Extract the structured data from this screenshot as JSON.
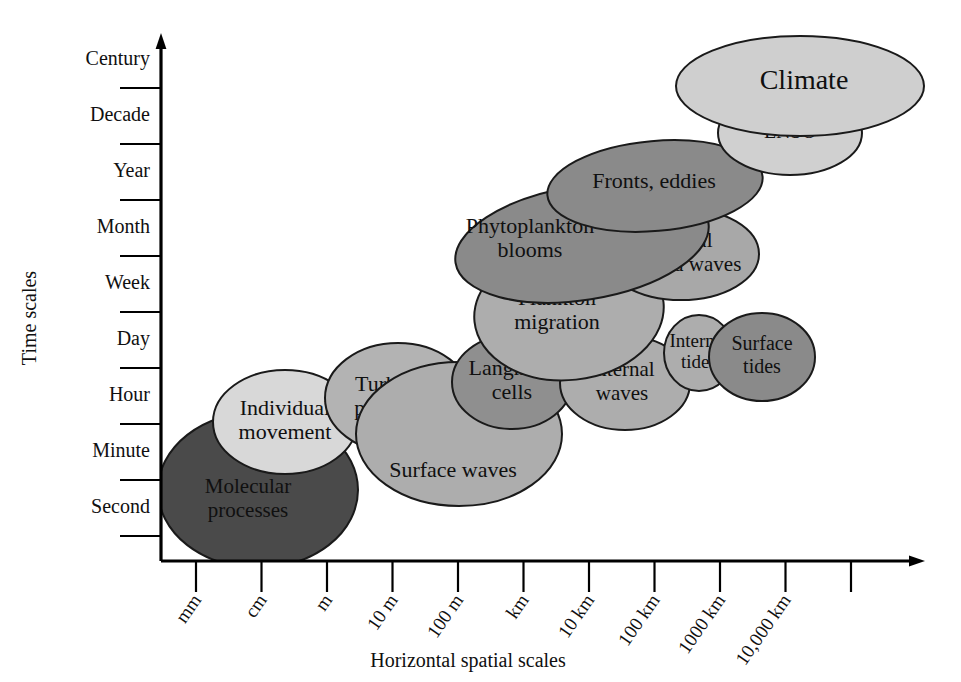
{
  "chart_data": {
    "type": "scatter",
    "title": "",
    "xlabel": "Horizontal spatial scales",
    "ylabel": "Time scales",
    "grid": false,
    "legend": "none",
    "xticks": [
      "mm",
      "cm",
      "m",
      "10 m",
      "100 m",
      "km",
      "10 km",
      "100 km",
      "1000 km",
      "10,000 km"
    ],
    "yticks": [
      "Century",
      "Decade",
      "Year",
      "Month",
      "Week",
      "Day",
      "Hour",
      "Minute",
      "Second"
    ],
    "xlim": [
      "mm",
      "beyond 10,000 km"
    ],
    "ylim": [
      "Second",
      "Century"
    ],
    "bubbles": [
      {
        "label": "Molecular processes",
        "label_lines": [
          "Molecular",
          "processes"
        ],
        "fill": "#4a4a4a",
        "text_color": "#141414",
        "font_size": 21,
        "cx": 258,
        "cy": 490,
        "rx": 100,
        "ry": 78,
        "rotate": 0,
        "label_dx": -10,
        "label_dy": 10,
        "x_scale": "mm",
        "y_scale": "Second to Minute"
      },
      {
        "label": "Individual movement",
        "label_lines": [
          "Individual",
          "movement"
        ],
        "fill": "#d8d8d8",
        "text_color": "#141414",
        "font_size": 22,
        "cx": 285,
        "cy": 422,
        "rx": 72,
        "ry": 52,
        "rotate": 0,
        "label_dx": 0,
        "label_dy": 0,
        "x_scale": "cm",
        "y_scale": "Minute to Hour"
      },
      {
        "label": "Turbulent patch size",
        "label_lines": [
          "Turbulent",
          "patch size"
        ],
        "fill": "#b3b3b3",
        "text_color": "#141414",
        "font_size": 22,
        "cx": 398,
        "cy": 398,
        "rx": 73,
        "ry": 55,
        "rotate": 0,
        "label_dx": 0,
        "label_dy": 0,
        "x_scale": "10 m",
        "y_scale": "Minute to Hour"
      },
      {
        "label": "Surface waves",
        "label_lines": [
          "Surface waves"
        ],
        "fill": "#adadad",
        "text_color": "#141414",
        "font_size": 22,
        "cx": 459,
        "cy": 434,
        "rx": 103,
        "ry": 72,
        "rotate": 0,
        "label_dx": -6,
        "label_dy": 38,
        "x_scale": "10 m to 100 m",
        "y_scale": "Second to Hour"
      },
      {
        "label": "Langmuir cells",
        "label_lines": [
          "Langmuir",
          "cells"
        ],
        "fill": "#8f8f8f",
        "text_color": "#141414",
        "font_size": 22,
        "cx": 512,
        "cy": 382,
        "rx": 60,
        "ry": 47,
        "rotate": 0,
        "label_dx": 0,
        "label_dy": 0,
        "x_scale": "100 m",
        "y_scale": "Hour"
      },
      {
        "label": "Internal waves",
        "label_lines": [
          "Internal",
          "waves"
        ],
        "fill": "#adadad",
        "text_color": "#141414",
        "font_size": 21,
        "cx": 625,
        "cy": 383,
        "rx": 65,
        "ry": 47,
        "rotate": 0,
        "label_dx": -3,
        "label_dy": 0,
        "x_scale": "10 km",
        "y_scale": "Hour to Day"
      },
      {
        "label": "Internal tides",
        "label_lines": [
          "Internal",
          "tides"
        ],
        "fill": "#adadad",
        "text_color": "#141414",
        "font_size": 19,
        "cx": 699,
        "cy": 353,
        "rx": 35,
        "ry": 38,
        "rotate": 0,
        "label_dx": 0,
        "label_dy": 0,
        "x_scale": "100 km",
        "y_scale": "Day"
      },
      {
        "label": "Surface tides",
        "label_lines": [
          "Surface",
          "tides"
        ],
        "fill": "#8a8a8a",
        "text_color": "#141414",
        "font_size": 20,
        "cx": 762,
        "cy": 357,
        "rx": 53,
        "ry": 44,
        "rotate": 0,
        "label_dx": 0,
        "label_dy": 0,
        "x_scale": "1000 km",
        "y_scale": "Day"
      },
      {
        "label": "Plankton migration",
        "label_lines": [
          "Plankton",
          "migration"
        ],
        "fill": "#adadad",
        "text_color": "#141414",
        "font_size": 22,
        "cx": 569,
        "cy": 312,
        "rx": 95,
        "ry": 68,
        "rotate": -6,
        "label_dx": -12,
        "label_dy": 0,
        "x_scale": "km",
        "y_scale": "Day to Week"
      },
      {
        "label": "Coastal trapped waves",
        "label_lines": [
          "Coastal",
          "trapped waves"
        ],
        "fill": "#a8a8a8",
        "text_color": "#141414",
        "font_size": 21,
        "cx": 681,
        "cy": 254,
        "rx": 78,
        "ry": 46,
        "rotate": 0,
        "label_dx": 0,
        "label_dy": 0,
        "x_scale": "100 km",
        "y_scale": "Week"
      },
      {
        "label": "Phytoplankton blooms",
        "label_lines": [
          "Phytoplankton",
          "blooms"
        ],
        "fill": "#8a8a8a",
        "text_color": "#141414",
        "font_size": 22,
        "cx": 582,
        "cy": 243,
        "rx": 128,
        "ry": 57,
        "rotate": -9,
        "label_dx": -52,
        "label_dy": -3,
        "x_scale": "km",
        "y_scale": "Week to Month"
      },
      {
        "label": "Fronts, eddies",
        "label_lines": [
          "Fronts, eddies"
        ],
        "fill": "#8a8a8a",
        "text_color": "#141414",
        "font_size": 22,
        "cx": 655,
        "cy": 186,
        "rx": 108,
        "ry": 45,
        "rotate": -5,
        "label_dx": -1,
        "label_dy": -3,
        "x_scale": "10 km to 100 km",
        "y_scale": "Month to Year"
      },
      {
        "label": "ENSO",
        "label_lines": [
          "ENSO"
        ],
        "fill": "#d0d0d0",
        "text_color": "#141414",
        "font_size": 20,
        "cx": 790,
        "cy": 133,
        "rx": 72,
        "ry": 42,
        "rotate": 0,
        "label_dx": 0,
        "label_dy": 0,
        "x_scale": "1000 km",
        "y_scale": "Year to Decade"
      },
      {
        "label": "Climate",
        "label_lines": [
          "Climate"
        ],
        "fill": "#cfcfcf",
        "text_color": "#141414",
        "font_size": 28,
        "cx": 800,
        "cy": 86,
        "rx": 124,
        "ry": 50,
        "rotate": 0,
        "label_dx": 4,
        "label_dy": -3,
        "x_scale": "1000 km to 10,000 km",
        "y_scale": "Decade to Century"
      }
    ]
  },
  "axes": {
    "x_axis_name": "horizontal-spatial-scales-axis",
    "y_axis_name": "time-scales-axis"
  }
}
